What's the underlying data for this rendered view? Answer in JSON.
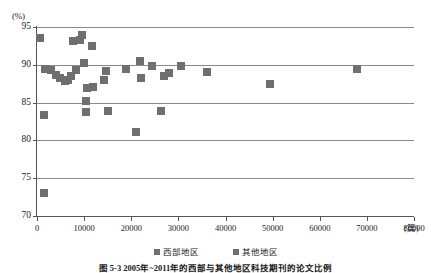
{
  "figure": {
    "caption": "图 5-3  2005年~2011年的西部与其他地区科技期刊的论文比例"
  },
  "legend": {
    "position": "bottom-center",
    "entries": [
      {
        "label": "西部地区",
        "color": "#6f6f6f",
        "marker": "square"
      },
      {
        "label": "其他地区",
        "color": "#6f6f6f",
        "marker": "square"
      }
    ]
  },
  "chart_data": {
    "type": "scatter",
    "title": "",
    "xlabel": "",
    "ylabel": "",
    "x_unit": "(篇)",
    "y_unit": "(%)",
    "xlim": [
      0,
      80000
    ],
    "ylim": [
      70,
      95
    ],
    "x_ticks": [
      0,
      10000,
      20000,
      30000,
      40000,
      50000,
      60000,
      70000,
      80000
    ],
    "y_ticks": [
      70,
      75,
      80,
      85,
      90,
      95
    ],
    "grid": "horizontal",
    "marker_color": "#6f6f6f",
    "series": [
      {
        "name": "西部地区",
        "points": [
          [
            700,
            93.6
          ],
          [
            1600,
            89.5
          ],
          [
            2900,
            89.3
          ],
          [
            4100,
            88.7
          ],
          [
            4900,
            88.2
          ],
          [
            5900,
            87.8
          ],
          [
            6600,
            88.0
          ],
          [
            7300,
            88.5
          ],
          [
            7700,
            93.2
          ],
          [
            8200,
            89.3
          ],
          [
            9100,
            93.3
          ],
          [
            9500,
            94.0
          ],
          [
            9900,
            90.3
          ],
          [
            11700,
            92.5
          ],
          [
            10600,
            86.9
          ],
          [
            10400,
            85.2
          ],
          [
            11900,
            87.0
          ],
          [
            14600,
            89.2
          ],
          [
            14200,
            88.0
          ],
          [
            15000,
            83.9
          ],
          [
            1500,
            83.3
          ],
          [
            10500,
            83.8
          ],
          [
            21000,
            81.1
          ],
          [
            1400,
            73.0
          ]
        ]
      },
      {
        "name": "其他地区",
        "points": [
          [
            18900,
            89.5
          ],
          [
            21800,
            90.5
          ],
          [
            22100,
            88.3
          ],
          [
            24300,
            89.8
          ],
          [
            27000,
            88.5
          ],
          [
            28100,
            88.9
          ],
          [
            30500,
            89.8
          ],
          [
            36000,
            89.1
          ],
          [
            49500,
            87.5
          ],
          [
            68000,
            89.4
          ],
          [
            26300,
            83.9
          ]
        ]
      }
    ]
  }
}
